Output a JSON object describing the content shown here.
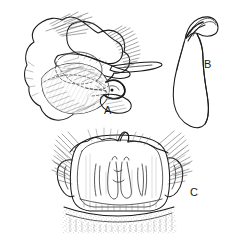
{
  "plate": {
    "background_color": "#ffffff",
    "ink_color": "#1a1a1a",
    "hatch_color": "#555555",
    "stipple_color": "#777777",
    "width": 237,
    "height": 246,
    "top_artifact_text": "",
    "panels": [
      {
        "id": "A",
        "label": "A",
        "label_x": 104,
        "label_y": 105,
        "subject": "male genital capsule, lateral view",
        "description": "Large irregular sclerite with overlapping plates, dashed internal margins, dense hair tufts on upper right and fine setae across the lower lobe"
      },
      {
        "id": "B",
        "label": "B",
        "label_x": 204,
        "label_y": 59,
        "subject": "aedeagus, lateral view",
        "description": "Elongate curved tapering structure with a hooked, bulbous apex at the upper right"
      },
      {
        "id": "C",
        "label": "C",
        "label_x": 190,
        "label_y": 187,
        "subject": "sternite / subgenital plate, ventral view",
        "description": "Broad shield-shaped plate with a median apical tooth, lateral bristle tufts, paired internal sclerotized rods and a stippled basal membrane band"
      }
    ]
  }
}
